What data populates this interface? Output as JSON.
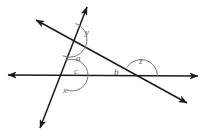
{
  "figure": {
    "type": "geometry-diagram",
    "width": 206,
    "height": 139,
    "background_color": "#ffffff",
    "line_color": "#1a1a1a",
    "label_color": "#5a5a5a",
    "arc_color": "#7a7a7a",
    "lines": [
      {
        "name": "horizontal-line",
        "x1": 6,
        "y1": 75,
        "x2": 200,
        "y2": 76,
        "arrows": "both"
      },
      {
        "name": "steep-line",
        "x1": 88,
        "y1": 5,
        "x2": 39,
        "y2": 130,
        "arrows": "both"
      },
      {
        "name": "diagonal-line",
        "x1": 34,
        "y1": 19,
        "x2": 189,
        "y2": 104,
        "arrows": "both"
      }
    ],
    "intersections": [
      {
        "name": "upper-intersection",
        "x": 69,
        "y": 39
      },
      {
        "name": "left-intersection",
        "x": 72,
        "y": 75
      },
      {
        "name": "right-intersection",
        "x": 141,
        "y": 76
      }
    ],
    "angle_labels": [
      {
        "name": "angle-y",
        "text": "y",
        "x": 85,
        "y": 28
      },
      {
        "name": "angle-a",
        "text": "a",
        "x": 76,
        "y": 54
      },
      {
        "name": "angle-c",
        "text": "c",
        "x": 74,
        "y": 67
      },
      {
        "name": "angle-x",
        "text": "x",
        "x": 63,
        "y": 86
      },
      {
        "name": "angle-b",
        "text": "b",
        "x": 114,
        "y": 68
      },
      {
        "name": "angle-z",
        "text": "z",
        "x": 139,
        "y": 57
      }
    ]
  }
}
